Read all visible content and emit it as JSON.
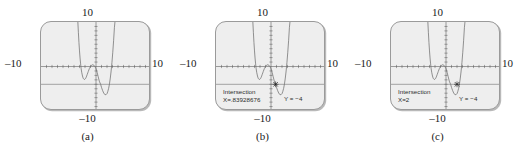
{
  "figure": {
    "panel_count": 3,
    "panels": [
      {
        "caption": "(a)",
        "axis_labels": {
          "top": "10",
          "bottom": "–10",
          "left": "–10",
          "right": "10"
        },
        "readout": {
          "visible": false,
          "line1": "",
          "line2": "",
          "y_label": ""
        },
        "cursor": {
          "visible": false,
          "x": 0.83928676,
          "y": -4
        }
      },
      {
        "caption": "(b)",
        "axis_labels": {
          "top": "10",
          "bottom": "–10",
          "left": "–10",
          "right": "10"
        },
        "readout": {
          "visible": true,
          "line1": "Intersection",
          "line2": "X=.83928676",
          "y_label": "Y = −4"
        },
        "cursor": {
          "visible": true,
          "x": 0.83928676,
          "y": -4
        }
      },
      {
        "caption": "(c)",
        "axis_labels": {
          "top": "10",
          "bottom": "–10",
          "left": "–10",
          "right": "10"
        },
        "readout": {
          "visible": true,
          "line1": "Intersection",
          "line2": "X=2",
          "y_label": "Y = −4"
        },
        "cursor": {
          "visible": true,
          "x": 2,
          "y": -4
        }
      }
    ]
  },
  "chart_data": {
    "type": "line",
    "title": "",
    "xlabel": "",
    "ylabel": "",
    "xlim": [
      -10,
      10
    ],
    "ylim": [
      -10,
      10
    ],
    "grid": false,
    "tick_spacing": 1,
    "axis_ticks_x": [
      -9,
      -8,
      -7,
      -6,
      -5,
      -4,
      -3,
      -2,
      -1,
      1,
      2,
      3,
      4,
      5,
      6,
      7,
      8,
      9
    ],
    "axis_ticks_y": [
      -9,
      -8,
      -7,
      -6,
      -5,
      -4,
      -3,
      -2,
      -1,
      1,
      2,
      3,
      4,
      5,
      6,
      7,
      8,
      9
    ],
    "series": [
      {
        "name": "curve",
        "color": "#6f6f6f",
        "points": [
          [
            -3.3,
            10.0
          ],
          [
            -3.2,
            7.6
          ],
          [
            -3.1,
            5.4
          ],
          [
            -3.0,
            3.5
          ],
          [
            -2.9,
            1.9
          ],
          [
            -2.8,
            0.6
          ],
          [
            -2.7,
            -0.5
          ],
          [
            -2.6,
            -1.3
          ],
          [
            -2.5,
            -1.9
          ],
          [
            -2.4,
            -2.4
          ],
          [
            -2.3,
            -2.7
          ],
          [
            -2.2,
            -2.85
          ],
          [
            -2.1,
            -2.9
          ],
          [
            -2.0,
            -2.85
          ],
          [
            -1.9,
            -2.7
          ],
          [
            -1.8,
            -2.45
          ],
          [
            -1.7,
            -2.15
          ],
          [
            -1.6,
            -1.8
          ],
          [
            -1.5,
            -1.45
          ],
          [
            -1.4,
            -1.1
          ],
          [
            -1.2,
            -0.45
          ],
          [
            -1.0,
            0.0
          ],
          [
            -0.8,
            0.3
          ],
          [
            -0.6,
            0.4
          ],
          [
            -0.4,
            0.3
          ],
          [
            -0.2,
            0.0
          ],
          [
            0.0,
            -0.5
          ],
          [
            0.2,
            -1.3
          ],
          [
            0.4,
            -2.3
          ],
          [
            0.6,
            -3.3
          ],
          [
            0.839,
            -4.0
          ],
          [
            1.0,
            -4.7
          ],
          [
            1.2,
            -5.4
          ],
          [
            1.4,
            -5.95
          ],
          [
            1.6,
            -6.3
          ],
          [
            1.8,
            -6.35
          ],
          [
            2.0,
            -6.1
          ],
          [
            2.15,
            -5.6
          ],
          [
            2.3,
            -4.9
          ],
          [
            2.45,
            -3.9
          ],
          [
            2.6,
            -2.6
          ],
          [
            2.75,
            -1.0
          ],
          [
            2.9,
            0.9
          ],
          [
            3.05,
            3.2
          ],
          [
            3.2,
            5.8
          ],
          [
            3.35,
            8.8
          ],
          [
            3.45,
            10.0
          ]
        ]
      },
      {
        "name": "horizontal-line-y-equals-minus-4",
        "color": "#6f6f6f",
        "type": "horizontal",
        "y": -4,
        "x_from": -10,
        "x_to": 10
      }
    ]
  },
  "colors": {
    "screen_background": "#eeeeee",
    "screen_border": "#9a9a9a",
    "curve": "#6f6f6f",
    "axis": "#555555",
    "text": "#1a1a1a",
    "cursor": "#222222"
  }
}
